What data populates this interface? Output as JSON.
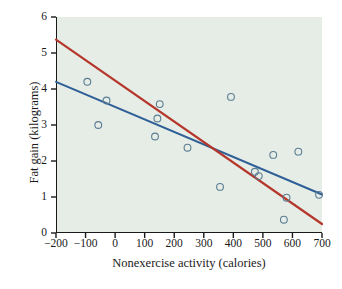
{
  "chart_data": {
    "type": "scatter",
    "title": "",
    "xlabel": "Nonexercise activity (calories)",
    "ylabel": "Fat gain (kilograms)",
    "xlim": [
      -200,
      700
    ],
    "ylim": [
      0,
      6
    ],
    "xticks": [
      -200,
      -100,
      0,
      100,
      200,
      300,
      400,
      500,
      600,
      700
    ],
    "yticks": [
      0,
      1,
      2,
      3,
      4,
      5,
      6
    ],
    "xtick_labels": [
      "−200",
      "−100",
      "0",
      "100",
      "200",
      "300",
      "400",
      "500",
      "600",
      "700"
    ],
    "ytick_labels": [
      "0",
      "1",
      "2",
      "3",
      "4",
      "5",
      "6"
    ],
    "grid": false,
    "legend": "none",
    "background_color": "#e6ede6",
    "points": [
      {
        "x": -94,
        "y": 4.2
      },
      {
        "x": -57,
        "y": 3.0
      },
      {
        "x": -29,
        "y": 3.68
      },
      {
        "x": 135,
        "y": 2.68
      },
      {
        "x": 143,
        "y": 3.18
      },
      {
        "x": 151,
        "y": 3.58
      },
      {
        "x": 245,
        "y": 2.37
      },
      {
        "x": 355,
        "y": 1.28
      },
      {
        "x": 392,
        "y": 3.78
      },
      {
        "x": 473,
        "y": 1.7
      },
      {
        "x": 486,
        "y": 1.58
      },
      {
        "x": 535,
        "y": 2.17
      },
      {
        "x": 571,
        "y": 0.37
      },
      {
        "x": 580,
        "y": 0.98
      },
      {
        "x": 620,
        "y": 2.26
      },
      {
        "x": 690,
        "y": 1.06
      }
    ],
    "marker": {
      "shape": "open-circle",
      "radius": 3.4,
      "stroke_color": "#5b7c93",
      "fill": "none",
      "stroke_width": 1.1
    },
    "series": [
      {
        "name": "blue-regression-line",
        "type": "line",
        "color": "#2e5f96",
        "width": 2.0,
        "x": [
          -200,
          700
        ],
        "y": [
          4.2,
          1.07
        ]
      },
      {
        "name": "red-regression-line",
        "type": "line",
        "color": "#b5372b",
        "width": 2.2,
        "x": [
          -200,
          700
        ],
        "y": [
          5.37,
          0.25
        ]
      }
    ]
  }
}
